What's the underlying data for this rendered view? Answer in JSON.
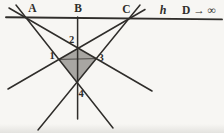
{
  "figure": {
    "labels": {
      "A": "A",
      "B": "B",
      "C": "C",
      "h": "h",
      "D": "D → ∞",
      "p1": "1",
      "p2": "2",
      "p3": "3",
      "p4": "4"
    },
    "colors": {
      "line": "#2f2d2a",
      "shade": "#a8a6a2",
      "background": "#f7f6f3"
    }
  }
}
